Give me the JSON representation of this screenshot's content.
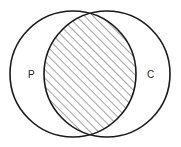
{
  "diagram": {
    "type": "venn",
    "sets": [
      {
        "id": "P",
        "label": "P",
        "cx": 73,
        "cy": 74,
        "r": 63
      },
      {
        "id": "C",
        "label": "C",
        "cx": 107,
        "cy": 74,
        "r": 63
      }
    ],
    "intersection": {
      "sets": [
        "P",
        "C"
      ],
      "fill": "hatched",
      "hatch_angle_deg": 45,
      "hatch_spacing": 6
    },
    "colors": {
      "stroke": "#1a1a1a",
      "hatch": "#555555",
      "background": "#ffffff"
    }
  }
}
